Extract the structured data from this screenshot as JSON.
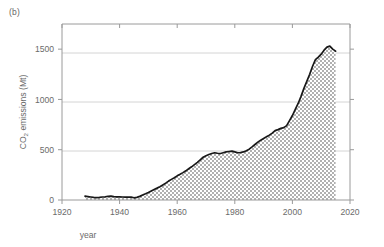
{
  "figure": {
    "panel_label": "(b)"
  },
  "chart_data": {
    "type": "area",
    "title": "",
    "subtitle": "",
    "panel_label": "(b)",
    "xlabel": "year",
    "ylabel_parts": {
      "pre": "CO",
      "sub": "2",
      "post": " emissions (Mt)"
    },
    "ylabel": "CO2 emissions (Mt)",
    "xlim": [
      1920,
      2020
    ],
    "ylim": [
      0,
      1750
    ],
    "xticks": [
      1920,
      1940,
      1960,
      1980,
      2000,
      2020
    ],
    "xticklabels": [
      "1920",
      "1940",
      "1960",
      "1980",
      "2000",
      "2020"
    ],
    "yticks": [
      0,
      500,
      1000,
      1500
    ],
    "yticklabels": [
      "0",
      "500",
      "1000",
      "1500"
    ],
    "grid": "horizontal",
    "legend": "none",
    "line_color": "#1a1a1a",
    "fill_color": "#b5b5b5",
    "fill_pattern": "checkerboard-hatch",
    "axis_color": "#9a9a9a",
    "grid_color": "#c8c8c8",
    "series": [
      {
        "name": "CO2 emissions",
        "x": [
          1928,
          1929,
          1930,
          1931,
          1932,
          1933,
          1934,
          1935,
          1936,
          1937,
          1938,
          1939,
          1940,
          1941,
          1942,
          1943,
          1944,
          1945,
          1946,
          1947,
          1948,
          1949,
          1950,
          1951,
          1952,
          1953,
          1954,
          1955,
          1956,
          1957,
          1958,
          1959,
          1960,
          1961,
          1962,
          1963,
          1964,
          1965,
          1966,
          1967,
          1968,
          1969,
          1970,
          1971,
          1972,
          1973,
          1974,
          1975,
          1976,
          1977,
          1978,
          1979,
          1980,
          1981,
          1982,
          1983,
          1984,
          1985,
          1986,
          1987,
          1988,
          1989,
          1990,
          1991,
          1992,
          1993,
          1994,
          1995,
          1996,
          1997,
          1998,
          1999,
          2000,
          2001,
          2002,
          2003,
          2004,
          2005,
          2006,
          2007,
          2008,
          2009,
          2010,
          2011,
          2012,
          2013,
          2014,
          2015
        ],
        "values": [
          38,
          34,
          30,
          26,
          24,
          26,
          30,
          32,
          36,
          38,
          34,
          32,
          32,
          30,
          28,
          30,
          28,
          22,
          26,
          36,
          50,
          62,
          75,
          90,
          105,
          118,
          132,
          150,
          168,
          188,
          205,
          222,
          240,
          255,
          272,
          290,
          310,
          330,
          352,
          375,
          400,
          425,
          440,
          452,
          462,
          470,
          465,
          462,
          470,
          478,
          482,
          486,
          478,
          470,
          472,
          478,
          490,
          505,
          528,
          552,
          575,
          595,
          612,
          628,
          645,
          665,
          690,
          700,
          712,
          720,
          740,
          790,
          840,
          900,
          960,
          1030,
          1110,
          1180,
          1250,
          1330,
          1395,
          1420,
          1450,
          1490,
          1520,
          1530,
          1500,
          1480
        ]
      }
    ]
  }
}
